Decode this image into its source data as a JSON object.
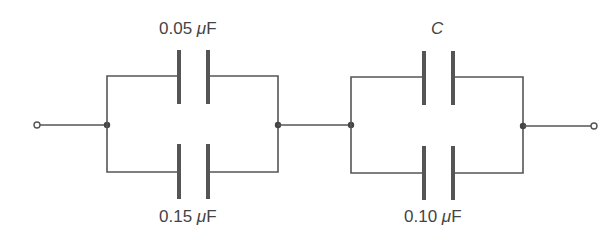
{
  "diagram": {
    "type": "capacitor-network",
    "stroke_color": "#555555",
    "text_color": "#444444",
    "groups": [
      {
        "name": "left-parallel-group",
        "capacitors": [
          {
            "position": "top",
            "value": "0.05",
            "unit": "μF",
            "unit_mu": "μ",
            "unit_f": "F"
          },
          {
            "position": "bottom",
            "value": "0.15",
            "unit": "μF",
            "unit_mu": "μ",
            "unit_f": "F"
          }
        ]
      },
      {
        "name": "right-parallel-group",
        "capacitors": [
          {
            "position": "top",
            "label": "C"
          },
          {
            "position": "bottom",
            "value": "0.10",
            "unit": "μF",
            "unit_mu": "μ",
            "unit_f": "F"
          }
        ]
      }
    ],
    "terminals": [
      "left",
      "right"
    ]
  }
}
